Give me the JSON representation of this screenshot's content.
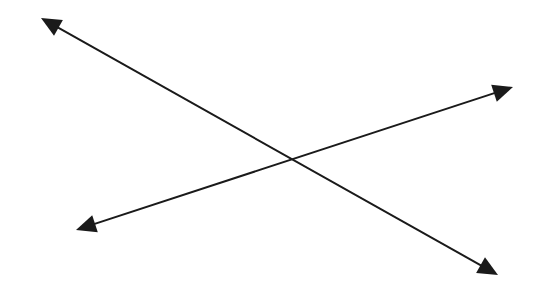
{
  "diagram": {
    "stroke_color": "#1a1a1a",
    "background": "#ffffff",
    "lines": [
      {
        "name": "line-descending",
        "start": [
          41,
          18
        ],
        "end": [
          498,
          275
        ],
        "arrow_start": true,
        "arrow_end": true
      },
      {
        "name": "line-ascending",
        "start": [
          76,
          230
        ],
        "end": [
          513,
          87
        ],
        "arrow_start": true,
        "arrow_end": true
      }
    ],
    "intersection": [
      292,
      158
    ]
  }
}
